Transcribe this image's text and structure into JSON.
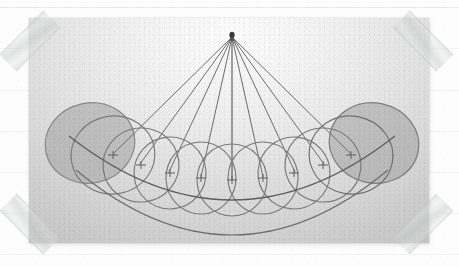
{
  "page": {
    "background_color": "#fdfdfe",
    "medium": "photograph taped to ruled notebook paper"
  },
  "paper": {
    "rule_color": "#e3e6ec",
    "rule_y_positions": [
      7,
      48,
      90,
      131,
      172,
      213,
      254
    ]
  },
  "tapes": [
    {
      "name": "tape-top-left",
      "corner": "top-left",
      "rotation_deg": 45,
      "color": "#cdd0ce"
    },
    {
      "name": "tape-top-right",
      "corner": "top-right",
      "rotation_deg": -45,
      "color": "#cdd0ce"
    },
    {
      "name": "tape-bottom-left",
      "corner": "bottom-left",
      "rotation_deg": -45,
      "color": "#cdd0ce"
    },
    {
      "name": "tape-bottom-right",
      "corner": "bottom-right",
      "rotation_deg": 45,
      "color": "#cdd0ce"
    }
  ],
  "photo": {
    "x": 29,
    "y": 18,
    "width": 400,
    "height": 225,
    "tone_light": "#fbfbfb",
    "tone_dark": "#b6b6b6",
    "subject": "swinging pendulum captured as overlapping exposures"
  },
  "diagram": {
    "type": "pendulum-multi-exposure",
    "pivot": {
      "x": 203,
      "y": 17,
      "radius": 2.6,
      "color": "#3a3a3a"
    },
    "line_color": "#6e6e6e",
    "strings": [
      {
        "index": 0,
        "end_x": 84,
        "end_y": 136
      },
      {
        "index": 1,
        "end_x": 111,
        "end_y": 146
      },
      {
        "index": 2,
        "end_x": 140,
        "end_y": 154
      },
      {
        "index": 3,
        "end_x": 172,
        "end_y": 159
      },
      {
        "index": 4,
        "end_x": 203,
        "end_y": 161
      },
      {
        "index": 5,
        "end_x": 234,
        "end_y": 159
      },
      {
        "index": 6,
        "end_x": 266,
        "end_y": 154
      },
      {
        "index": 7,
        "end_x": 295,
        "end_y": 146
      },
      {
        "index": 8,
        "end_x": 322,
        "end_y": 136
      }
    ],
    "balls": [
      {
        "index": 0,
        "cx": 61,
        "cy": 125,
        "rx": 45,
        "ry": 40,
        "rotate": -12,
        "filled": true,
        "fill": "#9e9e9e",
        "stroke": "#8a8a8a"
      },
      {
        "index": 1,
        "cx": 84,
        "cy": 137,
        "rx": 42,
        "ry": 39,
        "rotate": -10,
        "filled": false,
        "fill": "none",
        "stroke": "#7a7a7a"
      },
      {
        "index": 2,
        "cx": 112,
        "cy": 147,
        "rx": 38,
        "ry": 37,
        "rotate": -7,
        "filled": false,
        "fill": "none",
        "stroke": "#7a7a7a"
      },
      {
        "index": 3,
        "cx": 141,
        "cy": 155,
        "rx": 36,
        "ry": 36,
        "rotate": -4,
        "filled": false,
        "fill": "none",
        "stroke": "#7a7a7a"
      },
      {
        "index": 4,
        "cx": 172,
        "cy": 160,
        "rx": 35,
        "ry": 36,
        "rotate": -2,
        "filled": false,
        "fill": "none",
        "stroke": "#7a7a7a"
      },
      {
        "index": 5,
        "cx": 203,
        "cy": 162,
        "rx": 35,
        "ry": 36,
        "rotate": 0,
        "filled": false,
        "fill": "none",
        "stroke": "#7a7a7a"
      },
      {
        "index": 6,
        "cx": 234,
        "cy": 160,
        "rx": 35,
        "ry": 36,
        "rotate": 2,
        "filled": false,
        "fill": "none",
        "stroke": "#7a7a7a"
      },
      {
        "index": 7,
        "cx": 265,
        "cy": 155,
        "rx": 36,
        "ry": 36,
        "rotate": 4,
        "filled": false,
        "fill": "none",
        "stroke": "#7a7a7a"
      },
      {
        "index": 8,
        "cx": 294,
        "cy": 147,
        "rx": 38,
        "ry": 37,
        "rotate": 7,
        "filled": false,
        "fill": "none",
        "stroke": "#7a7a7a"
      },
      {
        "index": 9,
        "cx": 322,
        "cy": 137,
        "rx": 42,
        "ry": 39,
        "rotate": 10,
        "filled": false,
        "fill": "none",
        "stroke": "#6f6f6f"
      },
      {
        "index": 10,
        "cx": 345,
        "cy": 125,
        "rx": 45,
        "ry": 40,
        "rotate": 12,
        "filled": true,
        "fill": "#9e9e9e",
        "stroke": "#7d7d7d"
      }
    ],
    "centre_marks": [
      {
        "cx": 84,
        "cy": 137
      },
      {
        "cx": 112,
        "cy": 147
      },
      {
        "cx": 141,
        "cy": 155
      },
      {
        "cx": 172,
        "cy": 160
      },
      {
        "cx": 203,
        "cy": 162
      },
      {
        "cx": 234,
        "cy": 160
      },
      {
        "cx": 265,
        "cy": 155
      },
      {
        "cx": 294,
        "cy": 147
      },
      {
        "cx": 322,
        "cy": 137
      }
    ],
    "swing_arc": {
      "description": "arc traced by the pendulum bob through all exposure centres",
      "path": "M 40 118 Q 203 246 366 118",
      "stroke": "#5e5e5e"
    },
    "lower_arc": {
      "description": "lower envelope arc tangent to the bottoms of the circles",
      "path": "M 47 152 Q 203 282 359 152",
      "stroke": "#6b6b6b"
    }
  }
}
